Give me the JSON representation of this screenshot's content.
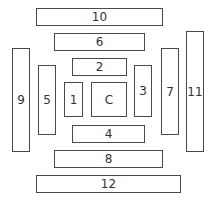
{
  "diagram": {
    "colors": {
      "border": "#4a4a4a",
      "text": "#333333",
      "background": "#ffffff"
    },
    "boxes": [
      {
        "label": "10",
        "x": 36,
        "y": 8,
        "w": 127,
        "h": 18
      },
      {
        "label": "6",
        "x": 54,
        "y": 33,
        "w": 91,
        "h": 18
      },
      {
        "label": "2",
        "x": 72,
        "y": 58,
        "w": 55,
        "h": 18
      },
      {
        "label": "9",
        "x": 12,
        "y": 48,
        "w": 18,
        "h": 104
      },
      {
        "label": "5",
        "x": 38,
        "y": 65,
        "w": 18,
        "h": 70
      },
      {
        "label": "1",
        "x": 64,
        "y": 82,
        "w": 19,
        "h": 35
      },
      {
        "label": "C",
        "x": 91,
        "y": 82,
        "w": 36,
        "h": 35
      },
      {
        "label": "3",
        "x": 134,
        "y": 65,
        "w": 18,
        "h": 52
      },
      {
        "label": "7",
        "x": 161,
        "y": 48,
        "w": 18,
        "h": 87
      },
      {
        "label": "11",
        "x": 186,
        "y": 31,
        "w": 18,
        "h": 121
      },
      {
        "label": "4",
        "x": 72,
        "y": 125,
        "w": 73,
        "h": 18
      },
      {
        "label": "8",
        "x": 54,
        "y": 150,
        "w": 109,
        "h": 18
      },
      {
        "label": "12",
        "x": 36,
        "y": 175,
        "w": 145,
        "h": 18
      }
    ]
  }
}
